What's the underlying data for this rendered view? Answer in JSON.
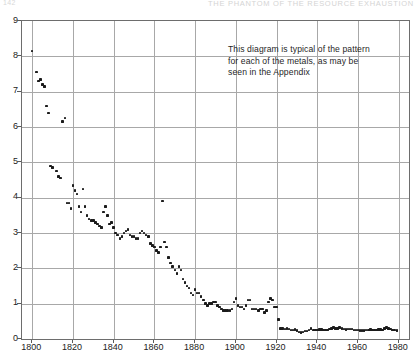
{
  "page": {
    "running_head_left": "142",
    "running_head_right": "THE PHANTOM OF THE RESOURCE EXHAUSTION"
  },
  "annotation": {
    "line1": "This diagram is typical of the pattern",
    "line2": "for each of the metals, as may be",
    "line3": "seen in the Appendix"
  },
  "chart_data": {
    "type": "scatter",
    "title": "",
    "subtitle": "",
    "xlabel": "",
    "ylabel": "",
    "xlim": [
      1795,
      1985
    ],
    "ylim": [
      0,
      9
    ],
    "grid": true,
    "legend": "none",
    "xticks": [
      1800,
      1820,
      1840,
      1860,
      1880,
      1900,
      1920,
      1940,
      1960,
      1980
    ],
    "yticks": [
      0,
      1,
      2,
      3,
      4,
      5,
      6,
      7,
      8,
      9
    ],
    "annotations": [
      {
        "text": "This diagram is typical of the pattern for each of the metals, as may be seen in the Appendix",
        "x": 1905,
        "y": 8.1
      }
    ],
    "series": [
      {
        "name": "price index",
        "marker": "square",
        "color": "#1b1b1b",
        "points": [
          [
            1800,
            8.15
          ],
          [
            1802,
            7.55
          ],
          [
            1803,
            7.3
          ],
          [
            1804,
            7.35
          ],
          [
            1805,
            7.2
          ],
          [
            1806,
            7.15
          ],
          [
            1807,
            6.6
          ],
          [
            1808,
            6.4
          ],
          [
            1809,
            4.9
          ],
          [
            1810,
            4.85
          ],
          [
            1812,
            4.75
          ],
          [
            1813,
            4.6
          ],
          [
            1814,
            4.55
          ],
          [
            1815,
            6.15
          ],
          [
            1816,
            6.25
          ],
          [
            1817,
            3.85
          ],
          [
            1818,
            3.85
          ],
          [
            1819,
            3.7
          ],
          [
            1820,
            4.35
          ],
          [
            1821,
            4.2
          ],
          [
            1822,
            4.1
          ],
          [
            1823,
            3.75
          ],
          [
            1824,
            3.6
          ],
          [
            1825,
            4.25
          ],
          [
            1826,
            3.75
          ],
          [
            1827,
            3.5
          ],
          [
            1828,
            3.4
          ],
          [
            1829,
            3.35
          ],
          [
            1830,
            3.35
          ],
          [
            1831,
            3.3
          ],
          [
            1832,
            3.25
          ],
          [
            1833,
            3.2
          ],
          [
            1834,
            3.15
          ],
          [
            1835,
            3.6
          ],
          [
            1836,
            3.75
          ],
          [
            1837,
            3.5
          ],
          [
            1838,
            3.25
          ],
          [
            1839,
            3.3
          ],
          [
            1840,
            3.15
          ],
          [
            1841,
            3.0
          ],
          [
            1842,
            2.95
          ],
          [
            1843,
            2.85
          ],
          [
            1844,
            2.9
          ],
          [
            1845,
            3.0
          ],
          [
            1846,
            3.05
          ],
          [
            1847,
            3.1
          ],
          [
            1848,
            2.95
          ],
          [
            1849,
            2.9
          ],
          [
            1850,
            2.9
          ],
          [
            1851,
            2.85
          ],
          [
            1852,
            2.85
          ],
          [
            1853,
            3.0
          ],
          [
            1854,
            3.05
          ],
          [
            1855,
            3.0
          ],
          [
            1856,
            2.95
          ],
          [
            1857,
            2.9
          ],
          [
            1858,
            2.7
          ],
          [
            1859,
            2.65
          ],
          [
            1860,
            2.6
          ],
          [
            1861,
            2.5
          ],
          [
            1862,
            2.45
          ],
          [
            1863,
            2.6
          ],
          [
            1864,
            3.9
          ],
          [
            1865,
            2.75
          ],
          [
            1866,
            2.6
          ],
          [
            1867,
            2.3
          ],
          [
            1868,
            2.15
          ],
          [
            1869,
            2.05
          ],
          [
            1870,
            1.95
          ],
          [
            1871,
            1.85
          ],
          [
            1872,
            2.05
          ],
          [
            1873,
            1.95
          ],
          [
            1874,
            1.7
          ],
          [
            1875,
            1.6
          ],
          [
            1876,
            1.5
          ],
          [
            1877,
            1.45
          ],
          [
            1878,
            1.3
          ],
          [
            1879,
            1.25
          ],
          [
            1880,
            1.4
          ],
          [
            1881,
            1.3
          ],
          [
            1882,
            1.3
          ],
          [
            1883,
            1.2
          ],
          [
            1884,
            1.1
          ],
          [
            1885,
            1.0
          ],
          [
            1886,
            0.95
          ],
          [
            1887,
            1.0
          ],
          [
            1888,
            1.0
          ],
          [
            1889,
            1.05
          ],
          [
            1890,
            1.05
          ],
          [
            1891,
            0.95
          ],
          [
            1892,
            0.9
          ],
          [
            1893,
            0.85
          ],
          [
            1894,
            0.8
          ],
          [
            1895,
            0.8
          ],
          [
            1896,
            0.8
          ],
          [
            1897,
            0.8
          ],
          [
            1898,
            0.85
          ],
          [
            1899,
            1.05
          ],
          [
            1900,
            1.15
          ],
          [
            1901,
            0.95
          ],
          [
            1902,
            0.9
          ],
          [
            1903,
            0.9
          ],
          [
            1904,
            0.85
          ],
          [
            1905,
            0.95
          ],
          [
            1906,
            1.1
          ],
          [
            1907,
            1.1
          ],
          [
            1908,
            0.85
          ],
          [
            1909,
            0.85
          ],
          [
            1910,
            0.85
          ],
          [
            1911,
            0.8
          ],
          [
            1912,
            0.85
          ],
          [
            1913,
            0.85
          ],
          [
            1914,
            0.75
          ],
          [
            1915,
            0.8
          ],
          [
            1916,
            1.05
          ],
          [
            1917,
            1.15
          ],
          [
            1918,
            1.1
          ],
          [
            1919,
            0.9
          ],
          [
            1920,
            0.9
          ],
          [
            1921,
            0.55
          ],
          [
            1922,
            0.3
          ],
          [
            1923,
            0.3
          ],
          [
            1924,
            0.28
          ],
          [
            1925,
            0.3
          ],
          [
            1926,
            0.28
          ],
          [
            1927,
            0.26
          ],
          [
            1928,
            0.26
          ],
          [
            1929,
            0.27
          ],
          [
            1930,
            0.24
          ],
          [
            1931,
            0.2
          ],
          [
            1932,
            0.18
          ],
          [
            1933,
            0.2
          ],
          [
            1934,
            0.22
          ],
          [
            1935,
            0.23
          ],
          [
            1936,
            0.25
          ],
          [
            1937,
            0.3
          ],
          [
            1938,
            0.25
          ],
          [
            1939,
            0.25
          ],
          [
            1940,
            0.26
          ],
          [
            1941,
            0.27
          ],
          [
            1942,
            0.27
          ],
          [
            1943,
            0.26
          ],
          [
            1944,
            0.26
          ],
          [
            1945,
            0.26
          ],
          [
            1946,
            0.28
          ],
          [
            1947,
            0.3
          ],
          [
            1948,
            0.32
          ],
          [
            1949,
            0.3
          ],
          [
            1950,
            0.3
          ],
          [
            1951,
            0.33
          ],
          [
            1952,
            0.3
          ],
          [
            1953,
            0.28
          ],
          [
            1954,
            0.27
          ],
          [
            1955,
            0.28
          ],
          [
            1956,
            0.29
          ],
          [
            1957,
            0.28
          ],
          [
            1958,
            0.26
          ],
          [
            1959,
            0.26
          ],
          [
            1960,
            0.25
          ],
          [
            1961,
            0.24
          ],
          [
            1962,
            0.24
          ],
          [
            1963,
            0.24
          ],
          [
            1964,
            0.25
          ],
          [
            1965,
            0.26
          ],
          [
            1966,
            0.27
          ],
          [
            1967,
            0.26
          ],
          [
            1968,
            0.25
          ],
          [
            1969,
            0.26
          ],
          [
            1970,
            0.27
          ],
          [
            1971,
            0.27
          ],
          [
            1972,
            0.26
          ],
          [
            1973,
            0.3
          ],
          [
            1974,
            0.33
          ],
          [
            1975,
            0.3
          ],
          [
            1976,
            0.28
          ],
          [
            1977,
            0.26
          ],
          [
            1978,
            0.25
          ],
          [
            1979,
            0.24
          ]
        ]
      }
    ]
  }
}
